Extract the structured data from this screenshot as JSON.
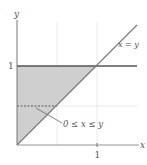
{
  "diagram": {
    "type": "region-of-integration",
    "axes": {
      "x_label": "x",
      "y_label": "y",
      "x_tick": "1",
      "y_tick": "1"
    },
    "curves": [
      {
        "name": "x = y",
        "label": "x = y"
      },
      {
        "name": "y = 1"
      }
    ],
    "region": {
      "label": "0 ≤ x ≤ y",
      "vertices": [
        [
          0,
          0
        ],
        [
          0,
          1
        ],
        [
          1,
          1
        ]
      ],
      "fill": "#cfcfcf"
    },
    "dashed_slice_y": 0.5
  },
  "colors": {
    "axis": "#777777",
    "line": "#666666",
    "bold_line": "#555555",
    "grid": "#e2e2e2",
    "fill": "#cfcfcf"
  }
}
